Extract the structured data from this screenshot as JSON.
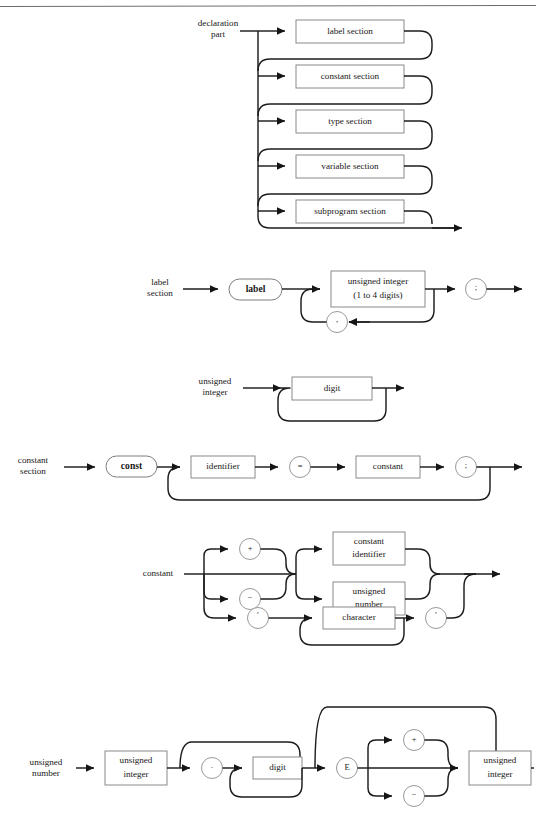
{
  "page": {
    "background_color": "#ffffff",
    "line_color": "#1c1c1c",
    "box_stroke_color": "#8a8a8a",
    "text_color": "#171717",
    "top_rule": true
  },
  "diagrams": [
    {
      "id": "declaration-part",
      "name": "declaration part",
      "label": "declaration\npart",
      "label_lines": [
        "declaration",
        "part"
      ],
      "type": "alternation-stack",
      "alternatives": [
        {
          "kind": "box",
          "text": "label section"
        },
        {
          "kind": "box",
          "text": "constant section"
        },
        {
          "kind": "box",
          "text": "type section"
        },
        {
          "kind": "box",
          "text": "variable section"
        },
        {
          "kind": "box",
          "text": "subprogram section"
        }
      ]
    },
    {
      "id": "label-section",
      "name": "label section",
      "label": "label\nsection",
      "label_lines": [
        "label",
        "section"
      ],
      "type": "sequence-with-loop",
      "elements": [
        {
          "kind": "oval",
          "text": "label"
        },
        {
          "kind": "box",
          "text_lines": [
            "unsigned integer",
            "(1 to 4 digits)"
          ]
        },
        {
          "kind": "circle",
          "text": ";"
        }
      ],
      "loop": {
        "kind": "circle",
        "text": ","
      }
    },
    {
      "id": "unsigned-integer",
      "name": "unsigned integer",
      "label": "unsigned\ninteger",
      "label_lines": [
        "unsigned",
        "integer"
      ],
      "type": "repeat",
      "elements": [
        {
          "kind": "box",
          "text": "digit"
        }
      ]
    },
    {
      "id": "constant-section",
      "name": "constant section",
      "label": "constant\nsection",
      "label_lines": [
        "constant",
        "section"
      ],
      "type": "sequence-with-loop",
      "elements": [
        {
          "kind": "oval",
          "text": "const"
        },
        {
          "kind": "box",
          "text": "identifier"
        },
        {
          "kind": "circle",
          "text": "="
        },
        {
          "kind": "box",
          "text": "constant"
        },
        {
          "kind": "circle",
          "text": ";"
        }
      ]
    },
    {
      "id": "constant",
      "name": "constant",
      "label": "constant",
      "label_lines": [
        "constant"
      ],
      "type": "branching",
      "sign_alternatives": [
        {
          "kind": "circle",
          "text": "+"
        },
        {
          "kind": "circle",
          "text": "−"
        },
        {
          "kind": "empty",
          "text": ""
        }
      ],
      "value_alternatives": [
        {
          "kind": "box",
          "text_lines": [
            "constant",
            "identifier"
          ]
        },
        {
          "kind": "box",
          "text_lines": [
            "unsigned",
            "number"
          ]
        }
      ],
      "char_branch": {
        "open_quote": {
          "kind": "circle",
          "text": "′"
        },
        "body": {
          "kind": "box",
          "text": "character"
        },
        "close_quote": {
          "kind": "circle",
          "text": "′"
        }
      }
    },
    {
      "id": "unsigned-number",
      "name": "unsigned number",
      "label": "unsigned\nnumber",
      "label_lines": [
        "unsigned",
        "number"
      ],
      "type": "sequence-with-optional",
      "elements": [
        {
          "kind": "box",
          "text_lines": [
            "unsigned",
            "integer"
          ]
        },
        {
          "kind": "circle",
          "text": "."
        },
        {
          "kind": "box",
          "text": "digit"
        },
        {
          "kind": "circle",
          "text": "E"
        },
        {
          "kind": "circle",
          "text": "+"
        },
        {
          "kind": "circle",
          "text": "−"
        },
        {
          "kind": "box",
          "text_lines": [
            "unsigned",
            "integer"
          ]
        }
      ]
    }
  ],
  "geometry": {
    "width": 536,
    "height": 833,
    "top_rule_y": 6
  }
}
